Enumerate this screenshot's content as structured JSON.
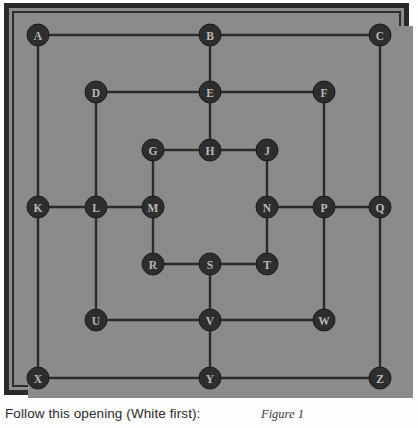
{
  "figure": {
    "caption": "Follow this opening (White first):",
    "figure_label": "Figure 1",
    "colors": {
      "board_surface": "#8b8b8b",
      "frame_dark": "#2a2a2a",
      "line": "#2b2b2b",
      "node_fill": "#2e2e2e",
      "node_text": "#b9b9b9",
      "page_background": "#fdfdfd"
    }
  },
  "board": {
    "type": "three-concentric-squares-morris-board",
    "ring_count": 3,
    "node_count": 24,
    "node_radius": 11,
    "skipped_letters": [
      "I",
      "O"
    ],
    "nodes": [
      {
        "id": "A",
        "label": "A",
        "x": 38,
        "y": 35,
        "ring": "outer",
        "position": "top-left"
      },
      {
        "id": "B",
        "label": "B",
        "x": 210,
        "y": 35,
        "ring": "outer",
        "position": "top-middle"
      },
      {
        "id": "C",
        "label": "C",
        "x": 380,
        "y": 35,
        "ring": "outer",
        "position": "top-right"
      },
      {
        "id": "D",
        "label": "D",
        "x": 96,
        "y": 92,
        "ring": "middle",
        "position": "top-left"
      },
      {
        "id": "E",
        "label": "E",
        "x": 210,
        "y": 92,
        "ring": "middle",
        "position": "top-middle"
      },
      {
        "id": "F",
        "label": "F",
        "x": 324,
        "y": 92,
        "ring": "middle",
        "position": "top-right"
      },
      {
        "id": "G",
        "label": "G",
        "x": 153,
        "y": 150,
        "ring": "inner",
        "position": "top-left"
      },
      {
        "id": "H",
        "label": "H",
        "x": 210,
        "y": 150,
        "ring": "inner",
        "position": "top-middle"
      },
      {
        "id": "J",
        "label": "J",
        "x": 267,
        "y": 150,
        "ring": "inner",
        "position": "top-right"
      },
      {
        "id": "K",
        "label": "K",
        "x": 38,
        "y": 207,
        "ring": "outer",
        "position": "left-middle"
      },
      {
        "id": "L",
        "label": "L",
        "x": 96,
        "y": 207,
        "ring": "middle",
        "position": "left-middle"
      },
      {
        "id": "M",
        "label": "M",
        "x": 153,
        "y": 207,
        "ring": "inner",
        "position": "left-middle"
      },
      {
        "id": "N",
        "label": "N",
        "x": 267,
        "y": 207,
        "ring": "inner",
        "position": "right-middle"
      },
      {
        "id": "P",
        "label": "P",
        "x": 324,
        "y": 207,
        "ring": "middle",
        "position": "right-middle"
      },
      {
        "id": "Q",
        "label": "Q",
        "x": 380,
        "y": 207,
        "ring": "outer",
        "position": "right-middle"
      },
      {
        "id": "R",
        "label": "R",
        "x": 153,
        "y": 264,
        "ring": "inner",
        "position": "bottom-left"
      },
      {
        "id": "S",
        "label": "S",
        "x": 210,
        "y": 264,
        "ring": "inner",
        "position": "bottom-middle"
      },
      {
        "id": "T",
        "label": "T",
        "x": 267,
        "y": 264,
        "ring": "inner",
        "position": "bottom-right"
      },
      {
        "id": "U",
        "label": "U",
        "x": 96,
        "y": 320,
        "ring": "middle",
        "position": "bottom-left"
      },
      {
        "id": "V",
        "label": "V",
        "x": 210,
        "y": 320,
        "ring": "middle",
        "position": "bottom-middle"
      },
      {
        "id": "W",
        "label": "W",
        "x": 324,
        "y": 320,
        "ring": "middle",
        "position": "bottom-right"
      },
      {
        "id": "X",
        "label": "X",
        "x": 38,
        "y": 378,
        "ring": "outer",
        "position": "bottom-left"
      },
      {
        "id": "Y",
        "label": "Y",
        "x": 210,
        "y": 378,
        "ring": "outer",
        "position": "bottom-middle"
      },
      {
        "id": "Z",
        "label": "Z",
        "x": 380,
        "y": 378,
        "ring": "outer",
        "position": "bottom-right"
      }
    ],
    "edges": [
      [
        "A",
        "B"
      ],
      [
        "B",
        "C"
      ],
      [
        "A",
        "K"
      ],
      [
        "K",
        "X"
      ],
      [
        "C",
        "Q"
      ],
      [
        "Q",
        "Z"
      ],
      [
        "X",
        "Y"
      ],
      [
        "Y",
        "Z"
      ],
      [
        "D",
        "E"
      ],
      [
        "E",
        "F"
      ],
      [
        "D",
        "L"
      ],
      [
        "L",
        "U"
      ],
      [
        "F",
        "P"
      ],
      [
        "P",
        "W"
      ],
      [
        "U",
        "V"
      ],
      [
        "V",
        "W"
      ],
      [
        "G",
        "H"
      ],
      [
        "H",
        "J"
      ],
      [
        "G",
        "M"
      ],
      [
        "M",
        "R"
      ],
      [
        "J",
        "N"
      ],
      [
        "N",
        "T"
      ],
      [
        "R",
        "S"
      ],
      [
        "S",
        "T"
      ],
      [
        "B",
        "E"
      ],
      [
        "E",
        "H"
      ],
      [
        "K",
        "L"
      ],
      [
        "L",
        "M"
      ],
      [
        "N",
        "P"
      ],
      [
        "P",
        "Q"
      ],
      [
        "S",
        "V"
      ],
      [
        "V",
        "Y"
      ]
    ]
  }
}
